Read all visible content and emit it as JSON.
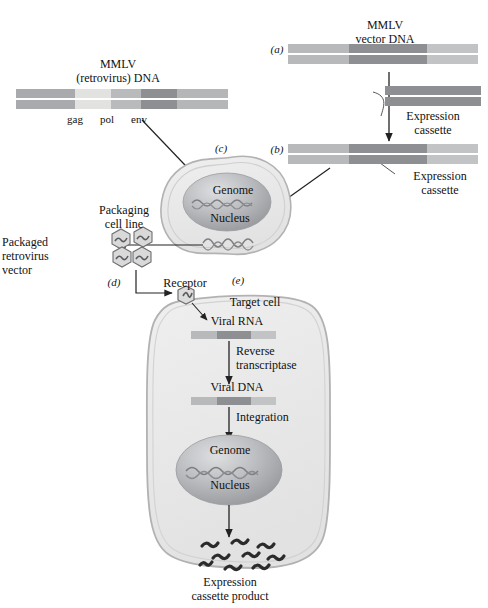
{
  "figure": {
    "type": "diagram",
    "panel_labels": [
      "(a)",
      "(b)",
      "(c)",
      "(d)",
      "(e)"
    ]
  },
  "mmlv_native": {
    "title_line1": "MMLV",
    "title_line2": "(retrovirus) DNA",
    "gene_labels": [
      "gag",
      "pol",
      "env"
    ],
    "segments": [
      {
        "name": "ltr-left",
        "color": "#a9aaad"
      },
      {
        "name": "gag",
        "color": "#e2e2e0"
      },
      {
        "name": "pol",
        "color": "#b9babc"
      },
      {
        "name": "env",
        "color": "#8e8f93"
      },
      {
        "name": "ltr-right",
        "color": "#b5b6b8"
      }
    ]
  },
  "vector_a": {
    "panel": "(a)",
    "title_line1": "MMLV",
    "title_line2": "vector DNA",
    "segments": [
      {
        "name": "ltr-left",
        "color": "#b8b9bb"
      },
      {
        "name": "core",
        "color": "#8e8f93"
      },
      {
        "name": "ltr-right",
        "color": "#c2c3c4"
      }
    ]
  },
  "expression_cassette_input": {
    "label_line1": "Expression",
    "label_line2": "cassette",
    "color": "#8e8f93"
  },
  "vector_b": {
    "panel": "(b)",
    "callout_line1": "Expression",
    "callout_line2": "cassette",
    "segments": [
      {
        "name": "ltr-left",
        "color": "#b8b9bb"
      },
      {
        "name": "cassette",
        "color": "#8e8f93"
      },
      {
        "name": "ltr-right",
        "color": "#c2c3c4"
      }
    ]
  },
  "packaging_cell": {
    "panel": "(c)",
    "nucleus_label": "Nucleus",
    "genome_label": "Genome",
    "cell_fill": "#e9e9e9",
    "nucleus_fill": "#b4b5b8"
  },
  "packaging_line": {
    "label_line1": "Packaging",
    "label_line2": "cell line",
    "vector_label_line1": "Packaged",
    "vector_label_line2": "retrovirus",
    "vector_label_line3": "vector",
    "particle_count": 4
  },
  "transduction": {
    "panel": "(d)",
    "receptor_label": "Receptor"
  },
  "target_cell": {
    "panel": "(e)",
    "title": "Target cell",
    "viral_rna_label": "Viral RNA",
    "step1_line1": "Reverse",
    "step1_line2": "transcriptase",
    "viral_dna_label": "Viral DNA",
    "step2": "Integration",
    "genome_label": "Genome",
    "nucleus_label": "Nucleus",
    "product_line1": "Expression",
    "product_line2": "cassette product",
    "cell_fill": "#e9e9e9",
    "nucleus_fill": "#b4b5b8",
    "rna_segments": [
      {
        "name": "ltr-left",
        "color": "#b8b9bb"
      },
      {
        "name": "cassette",
        "color": "#8e8f93"
      },
      {
        "name": "ltr-right",
        "color": "#c2c3c4"
      }
    ],
    "dna_segments": [
      {
        "name": "ltr-left",
        "color": "#b8b9bb"
      },
      {
        "name": "cassette",
        "color": "#8e8f93"
      },
      {
        "name": "ltr-right",
        "color": "#c2c3c4"
      }
    ],
    "product_particle_count": 9
  },
  "colors": {
    "ink": "#111111",
    "arrow": "#222222",
    "outline": "#9a9a9a",
    "cell_fill": "#e9e9e9",
    "nucleus_dark": "#9a9b9e",
    "nucleus_light": "#cfd0d2"
  }
}
